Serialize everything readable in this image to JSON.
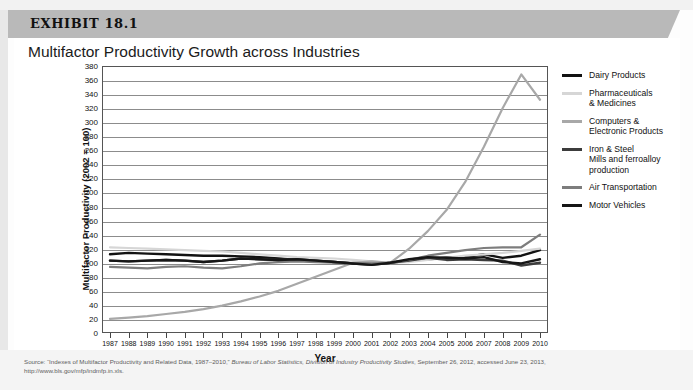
{
  "exhibit": {
    "label": "EXHIBIT 18.1"
  },
  "chart_title": "Multifactor Productivity Growth across Industries",
  "source_note": {
    "prefix": "Source: “Indexes of Multifactor Productivity and Related Data, 1987–2010,” ",
    "italic": "Bureau of Labor Statistics, Division of Industry Productivity Studies",
    "suffix": ", September 26, 2012, accessed June 23, 2013,",
    "url": "http://www.bls.gov/mfp/indmfp.in.xls."
  },
  "legend": {
    "items": [
      {
        "label": "Dairy Products",
        "color": "#121212"
      },
      {
        "label": "Pharmaceuticals\n& Medicines",
        "color": "#d6d6d6"
      },
      {
        "label": "Computers &\nElectronic Products",
        "color": "#a8a8a8"
      },
      {
        "label": "Iron & Steel\nMills and ferroalloy\nproduction",
        "color": "#3c3c3c"
      },
      {
        "label": "Air Transportation",
        "color": "#7d7d7d"
      },
      {
        "label": "Motor Vehicles",
        "color": "#161616"
      }
    ]
  },
  "chart_data": {
    "type": "line",
    "title": "Multifactor Productivity Growth across Industries",
    "xlabel": "Year",
    "ylabel": "Multifactor Productivity (2002 = 100)",
    "xlim": [
      1987,
      2010
    ],
    "ylim": [
      0,
      380
    ],
    "ytick_step": 20,
    "grid": true,
    "legend_position": "right",
    "categories": [
      "1987",
      "1988",
      "1989",
      "1990",
      "1991",
      "1992",
      "1993",
      "1994",
      "1995",
      "1996",
      "1997",
      "1998",
      "1999",
      "2000",
      "2001",
      "2002",
      "2003",
      "2004",
      "2005",
      "2006",
      "2007",
      "2008",
      "2009",
      "2010"
    ],
    "yticks": [
      "0",
      "20",
      "40",
      "60",
      "80",
      "100",
      "120",
      "140",
      "160",
      "180",
      "200",
      "220",
      "240",
      "260",
      "280",
      "300",
      "320",
      "340",
      "360",
      "380"
    ],
    "series": [
      {
        "name": "Dairy Products",
        "color": "#121212",
        "values": [
          112,
          114,
          113,
          112,
          111,
          110,
          110,
          109,
          108,
          106,
          104,
          103,
          101,
          99,
          98,
          100,
          103,
          105,
          107,
          108,
          112,
          107,
          110,
          118
        ]
      },
      {
        "name": "Pharmaceuticals & Medicines",
        "color": "#d6d6d6",
        "values": [
          122,
          121,
          120,
          119,
          118,
          117,
          116,
          114,
          112,
          110,
          108,
          107,
          106,
          104,
          102,
          100,
          101,
          104,
          107,
          110,
          112,
          114,
          117,
          120
        ]
      },
      {
        "name": "Computers & Electronic Products",
        "color": "#a8a8a8",
        "values": [
          20,
          22,
          24,
          27,
          30,
          34,
          39,
          45,
          52,
          60,
          70,
          80,
          90,
          100,
          102,
          100,
          120,
          145,
          175,
          215,
          265,
          320,
          368,
          332
        ]
      },
      {
        "name": "Iron & Steel Mills and ferroalloy production",
        "color": "#3c3c3c",
        "values": [
          103,
          102,
          103,
          104,
          103,
          101,
          103,
          106,
          105,
          104,
          105,
          103,
          101,
          99,
          97,
          100,
          103,
          107,
          104,
          105,
          104,
          103,
          96,
          100
        ]
      },
      {
        "name": "Air Transportation",
        "color": "#7d7d7d",
        "values": [
          94,
          93,
          92,
          94,
          95,
          93,
          92,
          95,
          99,
          101,
          102,
          101,
          100,
          100,
          99,
          100,
          104,
          110,
          114,
          118,
          121,
          122,
          122,
          140
        ]
      },
      {
        "name": "Motor Vehicles",
        "color": "#161616",
        "values": [
          103,
          102,
          103,
          104,
          103,
          101,
          103,
          106,
          105,
          104,
          105,
          103,
          101,
          99,
          97,
          100,
          105,
          108,
          107,
          106,
          108,
          101,
          99,
          105
        ]
      }
    ]
  }
}
